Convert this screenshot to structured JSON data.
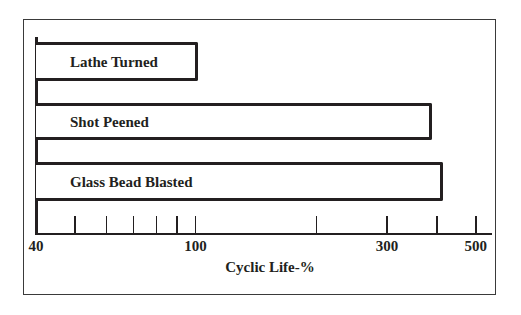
{
  "chart_data": {
    "type": "bar",
    "orientation": "horizontal",
    "title": "",
    "xlabel": "Cyclic Life-%",
    "ylabel": "",
    "xscale": "log",
    "xlim": [
      40,
      500
    ],
    "grid": false,
    "legend": null,
    "categories": [
      "Lathe Turned",
      "Shot Peened",
      "Glass Bead Blasted"
    ],
    "values": [
      100,
      385,
      410
    ],
    "x_tick_labels": [
      "40",
      "100",
      "300",
      "500"
    ],
    "x_ticks": [
      40,
      50,
      60,
      70,
      80,
      90,
      100,
      200,
      300,
      400,
      500
    ]
  },
  "bars": [
    {
      "label": "Lathe Turned",
      "value": 100,
      "top": 42,
      "height": 39
    },
    {
      "label": "Shot Peened",
      "value": 385,
      "top": 103,
      "height": 37
    },
    {
      "label": "Glass Bead Blasted",
      "value": 410,
      "top": 162,
      "height": 39
    }
  ],
  "axis": {
    "label": "Cyclic Life-%",
    "tick_labels": [
      {
        "text": "40",
        "value": 40
      },
      {
        "text": "100",
        "value": 100
      },
      {
        "text": "300",
        "value": 300
      },
      {
        "text": "500",
        "value": 500
      }
    ]
  }
}
